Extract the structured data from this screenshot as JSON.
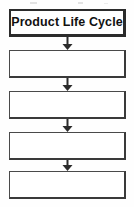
{
  "diagram": {
    "type": "flowchart",
    "orientation": "vertical",
    "title": "Product Life Cycle",
    "canvas": {
      "width": 134,
      "height": 207,
      "background": "#fefefe"
    },
    "colors": {
      "border": "#4a4a4a",
      "border_strong": "#2b2b2b",
      "fill": "#ffffff",
      "text": "#111111",
      "artifact": "#d9d9d9"
    },
    "nodes": [
      {
        "id": "node-1",
        "label": "Product Life Cycle",
        "filled": true,
        "x": 9,
        "y": 9,
        "width": 117,
        "height": 28
      },
      {
        "id": "node-2",
        "label": "",
        "filled": false,
        "x": 9,
        "y": 50,
        "width": 117,
        "height": 28
      },
      {
        "id": "node-3",
        "label": "",
        "filled": false,
        "x": 9,
        "y": 91,
        "width": 117,
        "height": 28
      },
      {
        "id": "node-4",
        "label": "",
        "filled": false,
        "x": 9,
        "y": 132,
        "width": 117,
        "height": 28
      },
      {
        "id": "node-5",
        "label": "",
        "filled": false,
        "x": 9,
        "y": 171,
        "width": 117,
        "height": 28
      }
    ],
    "connectors": [
      {
        "id": "arrow-1",
        "from": "node-1",
        "to": "node-2",
        "direction": "down",
        "x": 67,
        "y": 37,
        "length": 13
      },
      {
        "id": "arrow-2",
        "from": "node-2",
        "to": "node-3",
        "direction": "down",
        "x": 67,
        "y": 78,
        "length": 13
      },
      {
        "id": "arrow-3",
        "from": "node-3",
        "to": "node-4",
        "direction": "down",
        "x": 67,
        "y": 119,
        "length": 13
      },
      {
        "id": "arrow-4",
        "from": "node-4",
        "to": "node-5",
        "direction": "down",
        "x": 67,
        "y": 160,
        "length": 11
      }
    ],
    "artifacts": [
      {
        "id": "artifact-1",
        "x": 30,
        "y": 2,
        "width": 7,
        "height": 2
      },
      {
        "id": "artifact-2",
        "x": 78,
        "y": 2,
        "width": 5,
        "height": 2
      },
      {
        "id": "artifact-3",
        "x": 104,
        "y": 3,
        "width": 4,
        "height": 1
      }
    ]
  }
}
